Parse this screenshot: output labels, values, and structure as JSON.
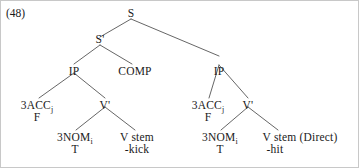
{
  "figure": {
    "example_number": "(48)",
    "width": 359,
    "height": 168,
    "line_color": "#555555",
    "text_color": "#1a1a1a",
    "background": "#ffffff"
  },
  "tree": {
    "root": {
      "label": "S"
    },
    "nodes": {
      "s": "S",
      "s_bar": "S'",
      "ip_left": "IP",
      "comp": "COMP",
      "ip_right": "IP",
      "v_bar_left": "V'",
      "v_bar_right": "V'"
    },
    "left_clause": {
      "agreement": {
        "label": "3ACC",
        "subscript": "j",
        "gloss": "F"
      },
      "subject": {
        "label": "3NOM",
        "subscript": "i",
        "gloss": "T"
      },
      "verb": {
        "label": "V stem",
        "gloss": "-kick"
      }
    },
    "right_clause": {
      "agreement": {
        "label": "3ACC",
        "subscript": "j",
        "gloss": "F"
      },
      "subject": {
        "label": "3NOM",
        "subscript": "i",
        "gloss": "T"
      },
      "verb": {
        "label": "V stem (Direct)",
        "gloss": "-hit"
      }
    }
  }
}
